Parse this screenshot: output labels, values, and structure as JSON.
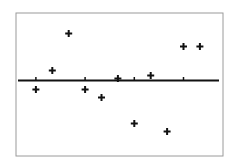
{
  "chart_data": {
    "type": "scatter",
    "title": "",
    "xlabel": "",
    "ylabel": "",
    "subtype": "residual plot",
    "grid": false,
    "legend": null,
    "x_ticks": [
      1,
      4,
      7,
      10
    ],
    "x": [
      1,
      2,
      3,
      4,
      5,
      6,
      7,
      8,
      9,
      10,
      11
    ],
    "values": [
      -0.9,
      1.0,
      4.7,
      -0.9,
      -1.7,
      0.2,
      -4.3,
      0.5,
      -5.1,
      3.4,
      3.4
    ],
    "xlim": [
      -0.2,
      12.2
    ],
    "ylim": [
      -7.5,
      6.8
    ],
    "reference_line": {
      "y": 0,
      "style": "solid",
      "thickness": 2
    },
    "marker": "plus"
  },
  "style": {
    "frame_color": "#9a9a9a",
    "line_color": "#111111",
    "marker_color": "#111111",
    "background": "#ffffff"
  }
}
